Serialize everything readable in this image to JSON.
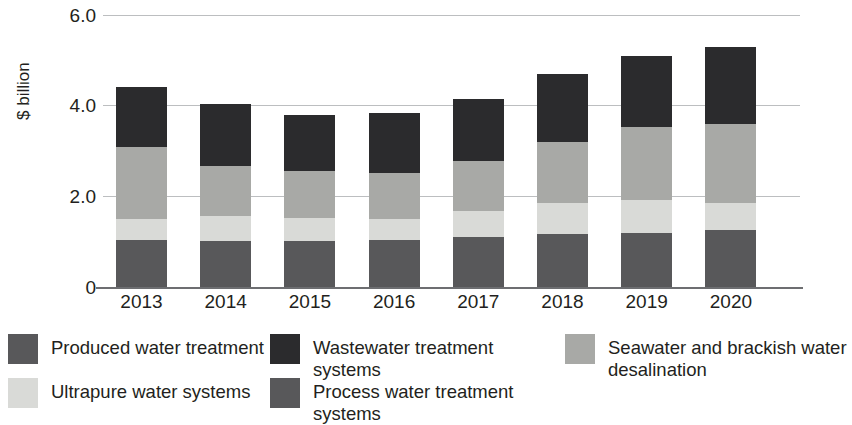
{
  "chart_data": {
    "type": "bar",
    "subtype": "stacked-bar",
    "title": "",
    "xlabel": "",
    "ylabel": "$ billion",
    "categories": [
      "2013",
      "2014",
      "2015",
      "2016",
      "2017",
      "2018",
      "2019",
      "2020"
    ],
    "ylim": [
      0,
      6.0
    ],
    "yticks": [
      "0",
      "2.0",
      "4.0",
      "6.0"
    ],
    "ytick_values": [
      0,
      2.0,
      4.0,
      6.0
    ],
    "grid": true,
    "legend_position": "bottom",
    "stack_order_bottom_to_top": [
      "Produced water treatment",
      "Process water treatment systems",
      "Ultrapure water systems",
      "Seawater and brackish water desalination",
      "Wastewater treatment systems"
    ],
    "series": [
      {
        "name": "Produced water treatment",
        "color": "#58585a",
        "values": [
          1.02,
          1.01,
          1.0,
          1.03,
          1.09,
          1.15,
          1.19,
          1.25
        ]
      },
      {
        "name": "Process water treatment systems",
        "color": "#58585a",
        "values": [
          0.0,
          0.0,
          0.0,
          0.0,
          0.0,
          0.0,
          0.0,
          0.0
        ]
      },
      {
        "name": "Ultrapure water systems",
        "color": "#d9dad7",
        "values": [
          0.48,
          0.54,
          0.51,
          0.45,
          0.57,
          0.68,
          0.72,
          0.6
        ]
      },
      {
        "name": "Seawater and brackish water desalination",
        "color": "#a8a9a6",
        "values": [
          1.57,
          1.09,
          1.04,
          1.02,
          1.11,
          1.35,
          1.59,
          1.72
        ]
      },
      {
        "name": "Wastewater treatment systems",
        "color": "#2b2b2d",
        "values": [
          1.31,
          1.37,
          1.22,
          1.3,
          1.35,
          1.48,
          1.57,
          1.68
        ]
      }
    ],
    "totals": [
      4.38,
      4.01,
      3.77,
      3.8,
      4.12,
      4.66,
      5.07,
      5.25
    ]
  },
  "axis": {
    "y_label": "$ billion",
    "y_ticks": [
      "6.0",
      "4.0",
      "2.0",
      "0"
    ],
    "x_ticks": [
      "2013",
      "2014",
      "2015",
      "2016",
      "2017",
      "2018",
      "2019",
      "2020"
    ]
  },
  "legend": {
    "items": [
      {
        "label": "Produced water treatment",
        "color": "#58585a"
      },
      {
        "label": "Wastewater treatment systems",
        "color": "#2b2b2d"
      },
      {
        "label": "Seawater and brackish water desalination",
        "color": "#a8a9a6"
      },
      {
        "label": "Ultrapure water systems",
        "color": "#d9dad7"
      },
      {
        "label": "Process water treatment systems",
        "color": "#58585a"
      }
    ]
  }
}
